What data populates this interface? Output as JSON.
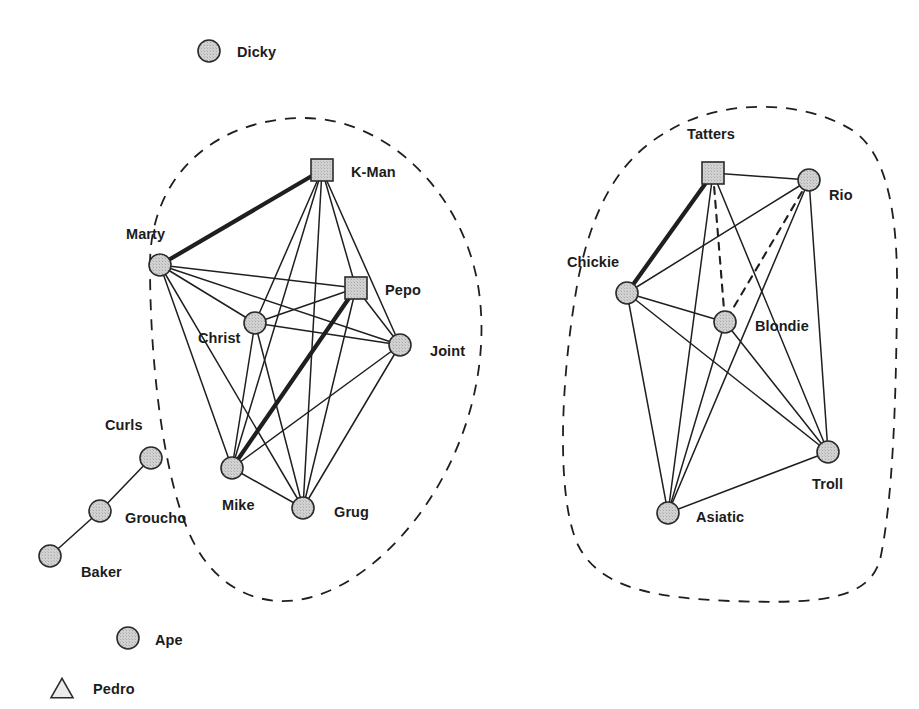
{
  "diagram": {
    "width": 919,
    "height": 709,
    "background_color": "#ffffff"
  },
  "style": {
    "node_fill": "#d2d2d2",
    "node_stroke": "#2b2b2b",
    "triangle_fill": "#ececec",
    "edge_color": "#1f1f1f",
    "boundary_color": "#1f1f1f",
    "label_color": "#1c1c1c",
    "circle_radius": 11,
    "square_size": 22,
    "triangle_size": 22
  },
  "legend": {
    "circle_meaning": "circle-node",
    "square_meaning": "square-node",
    "triangle_meaning": "triangle-node",
    "solid_edge_meaning": "solid-tie",
    "bold_edge_meaning": "strong-tie",
    "dashed_edge_meaning": "weak-tie",
    "boundary_meaning": "subgroup-boundary"
  },
  "chart_data": {
    "type": "network",
    "node_count": 19,
    "edge_count": 43,
    "group_count": 2,
    "nodes": [
      {
        "id": "dicky",
        "label": "Dicky",
        "shape": "circle",
        "x": 209,
        "y": 51,
        "label_x": 237,
        "label_y": 57,
        "group": null,
        "degree": 0
      },
      {
        "id": "kman",
        "label": "K-Man",
        "shape": "square",
        "x": 322,
        "y": 170,
        "label_x": 351,
        "label_y": 177,
        "group": "left",
        "degree": 6
      },
      {
        "id": "marty",
        "label": "Marty",
        "shape": "circle",
        "x": 160,
        "y": 265,
        "label_x": 126,
        "label_y": 239,
        "group": "left",
        "degree": 6
      },
      {
        "id": "pepo",
        "label": "Pepo",
        "shape": "square",
        "x": 356,
        "y": 288,
        "label_x": 385,
        "label_y": 295,
        "group": "left",
        "degree": 6
      },
      {
        "id": "christ",
        "label": "Christ",
        "shape": "circle",
        "x": 255,
        "y": 323,
        "label_x": 198,
        "label_y": 343,
        "group": "left",
        "degree": 6
      },
      {
        "id": "joint",
        "label": "Joint",
        "shape": "circle",
        "x": 400,
        "y": 345,
        "label_x": 430,
        "label_y": 356,
        "group": "left",
        "degree": 6
      },
      {
        "id": "mike",
        "label": "Mike",
        "shape": "circle",
        "x": 232,
        "y": 468,
        "label_x": 222,
        "label_y": 510,
        "group": "left",
        "degree": 6
      },
      {
        "id": "grug",
        "label": "Grug",
        "shape": "circle",
        "x": 303,
        "y": 508,
        "label_x": 334,
        "label_y": 517,
        "group": "left",
        "degree": 6
      },
      {
        "id": "curls",
        "label": "Curls",
        "shape": "circle",
        "x": 151,
        "y": 458,
        "label_x": 105,
        "label_y": 430,
        "group": null,
        "degree": 1
      },
      {
        "id": "groucho",
        "label": "Groucho",
        "shape": "circle",
        "x": 100,
        "y": 511,
        "label_x": 125,
        "label_y": 523,
        "group": null,
        "degree": 2
      },
      {
        "id": "baker",
        "label": "Baker",
        "shape": "circle",
        "x": 50,
        "y": 556,
        "label_x": 81,
        "label_y": 577,
        "group": null,
        "degree": 1
      },
      {
        "id": "ape",
        "label": "Ape",
        "shape": "circle",
        "x": 128,
        "y": 638,
        "label_x": 155,
        "label_y": 645,
        "group": null,
        "degree": 0
      },
      {
        "id": "pedro",
        "label": "Pedro",
        "shape": "triangle",
        "x": 62,
        "y": 688,
        "label_x": 93,
        "label_y": 694,
        "group": null,
        "degree": 0
      },
      {
        "id": "tatters",
        "label": "Tatters",
        "shape": "square",
        "x": 713,
        "y": 173,
        "label_x": 687,
        "label_y": 139,
        "group": "right",
        "degree": 5
      },
      {
        "id": "rio",
        "label": "Rio",
        "shape": "circle",
        "x": 809,
        "y": 180,
        "label_x": 829,
        "label_y": 200,
        "group": "right",
        "degree": 5
      },
      {
        "id": "chickie",
        "label": "Chickie",
        "shape": "circle",
        "x": 627,
        "y": 293,
        "label_x": 567,
        "label_y": 267,
        "group": "right",
        "degree": 5
      },
      {
        "id": "blondie",
        "label": "Blondie",
        "shape": "circle",
        "x": 725,
        "y": 322,
        "label_x": 755,
        "label_y": 331,
        "group": "right",
        "degree": 5
      },
      {
        "id": "troll",
        "label": "Troll",
        "shape": "circle",
        "x": 828,
        "y": 452,
        "label_x": 812,
        "label_y": 489,
        "group": "right",
        "degree": 5
      },
      {
        "id": "asiatic",
        "label": "Asiatic",
        "shape": "circle",
        "x": 668,
        "y": 513,
        "label_x": 696,
        "label_y": 522,
        "group": "right",
        "degree": 5
      }
    ],
    "edges": [
      {
        "source": "marty",
        "target": "kman",
        "style": "bold"
      },
      {
        "source": "marty",
        "target": "pepo",
        "style": "solid"
      },
      {
        "source": "marty",
        "target": "christ",
        "style": "solid"
      },
      {
        "source": "marty",
        "target": "joint",
        "style": "solid"
      },
      {
        "source": "marty",
        "target": "mike",
        "style": "solid"
      },
      {
        "source": "marty",
        "target": "grug",
        "style": "solid"
      },
      {
        "source": "kman",
        "target": "pepo",
        "style": "solid"
      },
      {
        "source": "kman",
        "target": "christ",
        "style": "solid"
      },
      {
        "source": "kman",
        "target": "joint",
        "style": "solid"
      },
      {
        "source": "kman",
        "target": "mike",
        "style": "solid"
      },
      {
        "source": "kman",
        "target": "grug",
        "style": "solid"
      },
      {
        "source": "pepo",
        "target": "christ",
        "style": "solid"
      },
      {
        "source": "pepo",
        "target": "joint",
        "style": "solid"
      },
      {
        "source": "pepo",
        "target": "mike",
        "style": "bold"
      },
      {
        "source": "pepo",
        "target": "grug",
        "style": "solid"
      },
      {
        "source": "christ",
        "target": "joint",
        "style": "solid"
      },
      {
        "source": "christ",
        "target": "mike",
        "style": "solid"
      },
      {
        "source": "christ",
        "target": "grug",
        "style": "solid"
      },
      {
        "source": "joint",
        "target": "mike",
        "style": "solid"
      },
      {
        "source": "joint",
        "target": "grug",
        "style": "solid"
      },
      {
        "source": "mike",
        "target": "grug",
        "style": "solid"
      },
      {
        "source": "curls",
        "target": "groucho",
        "style": "solid"
      },
      {
        "source": "groucho",
        "target": "baker",
        "style": "solid"
      },
      {
        "source": "tatters",
        "target": "rio",
        "style": "solid"
      },
      {
        "source": "tatters",
        "target": "chickie",
        "style": "bold"
      },
      {
        "source": "tatters",
        "target": "blondie",
        "style": "dashed"
      },
      {
        "source": "tatters",
        "target": "troll",
        "style": "solid"
      },
      {
        "source": "tatters",
        "target": "asiatic",
        "style": "solid"
      },
      {
        "source": "rio",
        "target": "chickie",
        "style": "solid"
      },
      {
        "source": "rio",
        "target": "blondie",
        "style": "dashed"
      },
      {
        "source": "rio",
        "target": "troll",
        "style": "solid"
      },
      {
        "source": "rio",
        "target": "asiatic",
        "style": "solid"
      },
      {
        "source": "chickie",
        "target": "blondie",
        "style": "solid"
      },
      {
        "source": "chickie",
        "target": "troll",
        "style": "solid"
      },
      {
        "source": "chickie",
        "target": "asiatic",
        "style": "solid"
      },
      {
        "source": "blondie",
        "target": "troll",
        "style": "solid"
      },
      {
        "source": "blondie",
        "target": "asiatic",
        "style": "solid"
      },
      {
        "source": "troll",
        "target": "asiatic",
        "style": "solid"
      }
    ],
    "groups": [
      {
        "id": "left",
        "label": "",
        "members": [
          "kman",
          "marty",
          "pepo",
          "christ",
          "joint",
          "mike",
          "grug"
        ],
        "boundary": "M 150 265 C 150 175, 215 120, 300 118 C 390 116, 470 200, 480 300 C 492 415, 430 530, 350 580 C 285 620, 225 600, 195 545 C 165 490, 150 370, 150 265 Z"
      },
      {
        "id": "right",
        "label": "",
        "members": [
          "tatters",
          "rio",
          "chickie",
          "blondie",
          "troll",
          "asiatic"
        ],
        "boundary": "M 670 130 C 720 100, 800 98, 852 130 C 892 156, 898 230, 897 300 C 896 400, 893 500, 880 560 C 868 600, 820 604, 730 601 C 660 598, 600 590, 578 545 C 556 498, 560 380, 578 280 C 596 190, 630 152, 670 130 Z"
      }
    ]
  }
}
